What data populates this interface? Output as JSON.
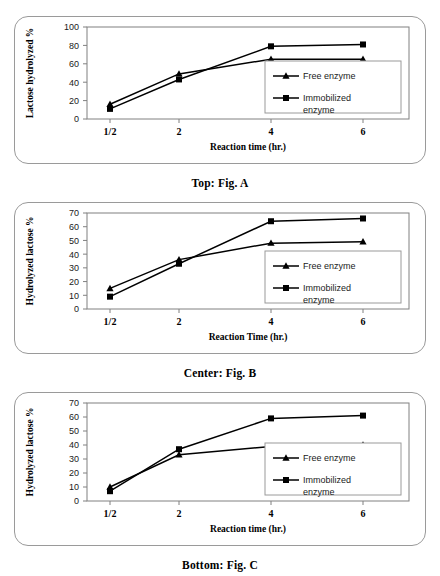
{
  "figures": [
    {
      "id": "a",
      "caption": "Top:  Fig. A",
      "chart_data": {
        "type": "line",
        "title": "",
        "xlabel": "Reaction time (hr.)",
        "ylabel": "Lactose hydrolyzed %",
        "categories": [
          "1/2",
          "2",
          "4",
          "6"
        ],
        "x": [
          0.5,
          2,
          4,
          6
        ],
        "xlim": [
          0,
          7
        ],
        "ylim": [
          0,
          100
        ],
        "yticks": [
          0,
          20,
          40,
          60,
          80,
          100
        ],
        "grid": false,
        "legend_position": "lower-right",
        "series": [
          {
            "name": "Free enzyme",
            "marker": "triangle",
            "values": [
              16,
              49,
              65,
              65
            ]
          },
          {
            "name": "Immobilized enzyme",
            "marker": "square",
            "values": [
              11,
              43,
              79,
              81
            ]
          }
        ]
      },
      "legend": [
        {
          "label": "Free enzyme",
          "marker": "triangle"
        },
        {
          "label": "Immobilized enzyme",
          "marker": "square"
        }
      ]
    },
    {
      "id": "b",
      "caption": "Center: Fig. B",
      "chart_data": {
        "type": "line",
        "title": "",
        "xlabel": "Reaction Time (hr.)",
        "ylabel": "Hydrolyzed lactose %",
        "categories": [
          "1/2",
          "2",
          "4",
          "6"
        ],
        "x": [
          0.5,
          2,
          4,
          6
        ],
        "xlim": [
          0,
          7
        ],
        "ylim": [
          0,
          70
        ],
        "yticks": [
          0,
          10,
          20,
          30,
          40,
          50,
          60,
          70
        ],
        "grid": false,
        "legend_position": "lower-right",
        "series": [
          {
            "name": "Free enzyme",
            "marker": "triangle",
            "values": [
              15,
              36,
              48,
              49
            ]
          },
          {
            "name": "Immobilized enzyme",
            "marker": "square",
            "values": [
              9,
              33,
              64,
              66
            ]
          }
        ]
      },
      "legend": [
        {
          "label": "Free enzyme",
          "marker": "triangle"
        },
        {
          "label": "Immobilized enzyme",
          "marker": "square"
        }
      ]
    },
    {
      "id": "c",
      "caption": "Bottom:  Fig. C",
      "chart_data": {
        "type": "line",
        "title": "",
        "xlabel": "Reaction time (hr.)",
        "ylabel": "Hydrolyzed lactose %",
        "categories": [
          "1/2",
          "2",
          "4",
          "6"
        ],
        "x": [
          0.5,
          2,
          4,
          6
        ],
        "xlim": [
          0,
          7
        ],
        "ylim": [
          0,
          70
        ],
        "yticks": [
          0,
          10,
          20,
          30,
          40,
          50,
          60,
          70
        ],
        "grid": false,
        "legend_position": "lower-right",
        "series": [
          {
            "name": "Free enzyme",
            "marker": "triangle",
            "values": [
              10,
              33,
              39,
              40
            ]
          },
          {
            "name": "Immobilized enzyme",
            "marker": "square",
            "values": [
              7,
              37,
              59,
              61
            ]
          }
        ]
      },
      "legend": [
        {
          "label": "Free enzyme",
          "marker": "triangle"
        },
        {
          "label": "Immobilized enzyme",
          "marker": "square"
        }
      ]
    }
  ],
  "colors": {
    "line": "#000000",
    "axis": "#808080",
    "panel_border": "#9a9a9a",
    "background": "#ffffff"
  }
}
